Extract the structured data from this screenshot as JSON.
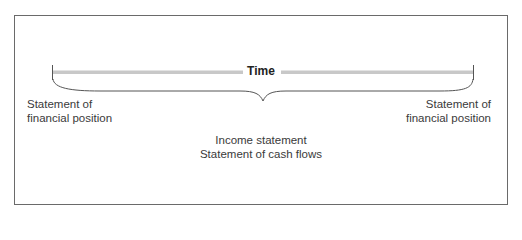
{
  "diagram": {
    "timeline": {
      "label": "Time",
      "bar_color": "#c8c8c8"
    },
    "start_label": {
      "line1": "Statement of",
      "line2": "financial position"
    },
    "end_label": {
      "line1": "Statement of",
      "line2": "financial position"
    },
    "period_labels": {
      "line1": "Income statement",
      "line2": "Statement of cash flows"
    },
    "colors": {
      "frame": "#6a6a6a",
      "text": "#3a3a3a",
      "bar": "#c8c8c8"
    }
  }
}
